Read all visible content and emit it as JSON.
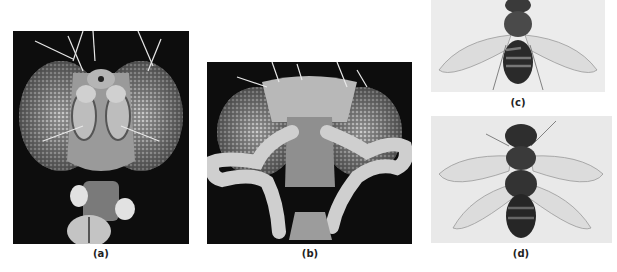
{
  "figure": {
    "panels": [
      {
        "id": "a",
        "label": "(a)",
        "subject": "SEM head of fruit fly, frontal view, normal antennae",
        "background": "#0d0d0d"
      },
      {
        "id": "b",
        "label": "(b)",
        "subject": "SEM head of fruit fly with legs in place of antennae (Antennapedia)",
        "background": "#0d0d0d"
      },
      {
        "id": "c",
        "label": "(c)",
        "subject": "Fruit fly, dorsal view, one pair of wings",
        "background": "#ececec"
      },
      {
        "id": "d",
        "label": "(d)",
        "subject": "Fruit fly, dorsal view, two pairs of wings (bithorax)",
        "background": "#e9e9e9"
      }
    ]
  }
}
